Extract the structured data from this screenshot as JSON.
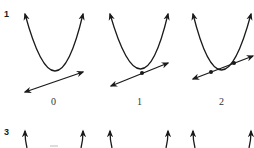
{
  "figure": {
    "rows": [
      {
        "label": "1",
        "panels": [
          {
            "caption": "0",
            "intersections": 0,
            "description": "parabola and line with no intersection"
          },
          {
            "caption": "1",
            "intersections": 1,
            "description": "line tangent to parabola at one point"
          },
          {
            "caption": "2",
            "intersections": 2,
            "description": "line crossing parabola at two points"
          }
        ]
      },
      {
        "label": "3",
        "panels": [
          {
            "caption": "",
            "description": "partially visible curves (cropped)"
          },
          {
            "caption": "",
            "description": "partially visible curves (cropped)"
          },
          {
            "caption": "",
            "description": "partially visible curves (cropped)"
          }
        ]
      }
    ],
    "colors": {
      "stroke": "#1a1a1a",
      "background": "#ffffff"
    }
  }
}
